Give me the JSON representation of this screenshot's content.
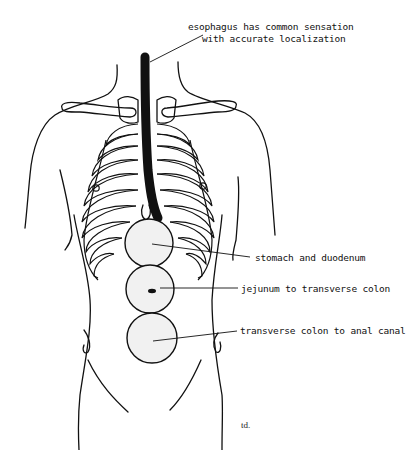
{
  "figure": {
    "signature": "td."
  },
  "labels": {
    "esophagus_line1": "esophagus has common sensation",
    "esophagus_line2": "with accurate localization",
    "stomach": "stomach and duodenum",
    "jejunum": "jejunum to transverse colon",
    "colon": "transverse colon to anal canal"
  },
  "regions": [
    {
      "name": "esophagus",
      "shape": "black tube",
      "color": "#111111"
    },
    {
      "name": "stomach and duodenum",
      "shape": "circle",
      "cx": 149,
      "cy": 243,
      "r": 24
    },
    {
      "name": "jejunum to transverse colon",
      "shape": "circle",
      "cx": 150,
      "cy": 289,
      "r": 24
    },
    {
      "name": "transverse colon to anal canal",
      "shape": "circle",
      "cx": 152,
      "cy": 338,
      "r": 25
    }
  ],
  "colors": {
    "line": "#111111",
    "region_fill": "#f1f1f1",
    "background": "#ffffff"
  }
}
